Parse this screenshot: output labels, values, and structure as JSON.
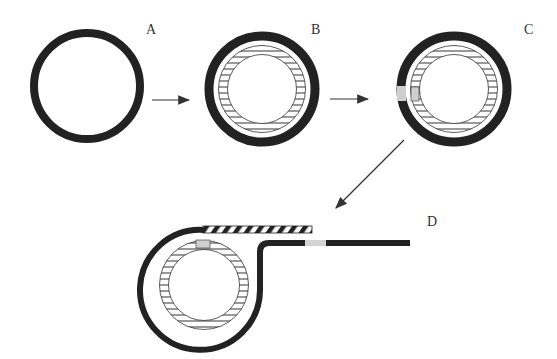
{
  "diagram": {
    "colors": {
      "background": "#ffffff",
      "ring": "#222222",
      "hatch_stroke": "#333333",
      "marker": "#cfcfcf",
      "arrow": "#333333"
    },
    "stages": [
      {
        "id": "A",
        "label": "A",
        "description": "plain dark ring"
      },
      {
        "id": "B",
        "label": "B",
        "description": "dark ring with inner hatched ring"
      },
      {
        "id": "C",
        "label": "C",
        "description": "dark ring with inner hatched ring, gray marker patches on left"
      },
      {
        "id": "D",
        "label": "D",
        "description": "outer ring unrolled into a strip; hatched flap above, gray marker on strip and inner ring"
      }
    ],
    "arrows": [
      {
        "from": "A",
        "to": "B"
      },
      {
        "from": "B",
        "to": "C"
      },
      {
        "from": "C",
        "to": "D"
      }
    ]
  }
}
